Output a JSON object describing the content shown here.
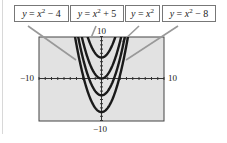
{
  "chart_data": {
    "type": "line",
    "title": "",
    "xlabel": "",
    "ylabel": "",
    "xlim": [
      -10,
      10
    ],
    "ylim": [
      -10,
      10
    ],
    "grid": false,
    "legend_position": "top (callout boxes with leader lines)",
    "tick_labels": {
      "x_min": "−10",
      "x_max": "10",
      "y_min": "−10",
      "y_max": "10"
    },
    "series": [
      {
        "name": "y = x^2 - 4",
        "vertex": [
          0,
          -4
        ]
      },
      {
        "name": "y = x^2 + 5",
        "vertex": [
          0,
          5
        ]
      },
      {
        "name": "y = x^2",
        "vertex": [
          0,
          0
        ]
      },
      {
        "name": "y = x^2 - 8",
        "vertex": [
          0,
          -8
        ]
      }
    ]
  },
  "labels": [
    {
      "lhs": "y",
      "eq": " = ",
      "var": "x",
      "exp": "2",
      "rest": " − 4"
    },
    {
      "lhs": "y",
      "eq": " = ",
      "var": "x",
      "exp": "2",
      "rest": " + 5"
    },
    {
      "lhs": "y",
      "eq": " = ",
      "var": "x",
      "exp": "2",
      "rest": ""
    },
    {
      "lhs": "y",
      "eq": " = ",
      "var": "x",
      "exp": "2",
      "rest": " − 8"
    }
  ],
  "colors": {
    "frame_fill": "#e2e2e2",
    "curve": "#1a1a1a",
    "frame_border": "#444444"
  }
}
